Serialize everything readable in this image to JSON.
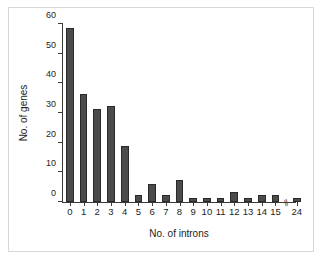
{
  "chart_data": {
    "type": "bar",
    "title": "",
    "xlabel": "No. of introns",
    "ylabel": "No. of genes",
    "categories": [
      "0",
      "1",
      "2",
      "3",
      "4",
      "5",
      "6",
      "7",
      "8",
      "9",
      "10",
      "11",
      "12",
      "13",
      "14",
      "15",
      "24"
    ],
    "values": [
      58.5,
      36.5,
      31.5,
      32.5,
      19,
      2.5,
      6,
      2.5,
      7.5,
      1.5,
      1.5,
      1.5,
      3.5,
      1.5,
      2.5,
      2.5,
      1.5
    ],
    "ylim": [
      0,
      60
    ],
    "yticks": [
      0,
      10,
      20,
      30,
      40,
      50,
      60
    ],
    "ytick_labels": [
      "0",
      "10",
      "20",
      "30",
      "40",
      "50",
      "60"
    ],
    "grid": false,
    "legend": null,
    "axis_break": {
      "between": [
        "15",
        "24"
      ],
      "symbol": "//"
    },
    "bar_color": "#4b4b4b",
    "bar_edge_color": "#2a2a2a",
    "axis_color": "#3a3a3a",
    "background_color": "#ffffff",
    "frame_color": "#d8d8d4"
  }
}
